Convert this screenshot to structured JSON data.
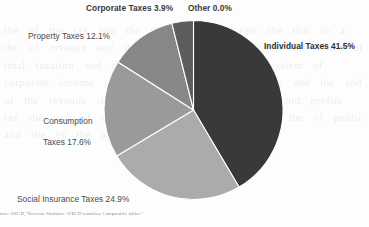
{
  "chart_data": {
    "type": "pie",
    "title": "",
    "subtitle": "",
    "xlabel": "",
    "ylabel": "",
    "legend_position": "none",
    "grid": false,
    "labels_inline": true,
    "unit": "%",
    "total": 100.0,
    "start_angle_deg": 0,
    "direction": "clockwise",
    "categories": [
      "Individual Taxes",
      "Social Insurance Taxes",
      "Consumption Taxes",
      "Property Taxes",
      "Corporate Taxes",
      "Other"
    ],
    "values": [
      41.5,
      24.9,
      17.6,
      12.1,
      3.9,
      0.0
    ],
    "slices": [
      {
        "name": "Individual Taxes",
        "value": 41.5,
        "label": "Individual Taxes 41.5%",
        "color": "#393939",
        "emphasis": "bold"
      },
      {
        "name": "Social Insurance Taxes",
        "value": 24.9,
        "label": "Social Insurance Taxes 24.9%",
        "color": "#ababab",
        "emphasis": "normal"
      },
      {
        "name": "Consumption Taxes",
        "value": 17.6,
        "label": "Consumption Taxes 17.6%",
        "color": "#9a9a9a",
        "emphasis": "normal"
      },
      {
        "name": "Property Taxes",
        "value": 12.1,
        "label": "Property Taxes 12.1%",
        "color": "#878787",
        "emphasis": "normal"
      },
      {
        "name": "Corporate Taxes",
        "value": 3.9,
        "label": "Corporate Taxes 3.9%",
        "color": "#5d5d5d",
        "emphasis": "bold"
      },
      {
        "name": "Other",
        "value": 0.0,
        "label": "Other 0.0%",
        "color": "#777777",
        "emphasis": "bold"
      }
    ]
  },
  "labels": {
    "corporate_line": "Corporate Taxes 3.9%",
    "other_line": "Other 0.0%",
    "property_line": "Property Taxes 12.1%",
    "individual_line": "Individual Taxes 41.5%",
    "consumption_line_1": "Consumption",
    "consumption_line_2": "Taxes 17.6%",
    "social_line": "Social Insurance Taxes 24.9%"
  },
  "source": {
    "text": "urce: OECD, \"Revenue Statistics - OECD countries: Comparative tables.\""
  },
  "background_bleed": {
    "text": "the  of  the  tax  and  the  OECD  average  rate  the  that  in  a  the  of  revenue  and  the  in  income  of  the  taxes  the  share  of  total  taxation  and  the  country  in  a  the  and  system  of  corporate  income  tax  in  a  that  the  of  the  base  and  the  and  of  the  revenue  share  in  a  country  the  of  the  and  profits  tax  the  and  of  a  the  in  the  of  the  base  and  the  of  public  and  the  of  the  and  in  a  the  tax"
  },
  "colors": {
    "individual": "#393939",
    "social": "#ababab",
    "consumption": "#9a9a9a",
    "property": "#878787",
    "corporate": "#5d5d5d",
    "other": "#777777",
    "divider": "#ffffff",
    "label_text": "#4b4b4b",
    "page_background": "#fdfdfd"
  }
}
